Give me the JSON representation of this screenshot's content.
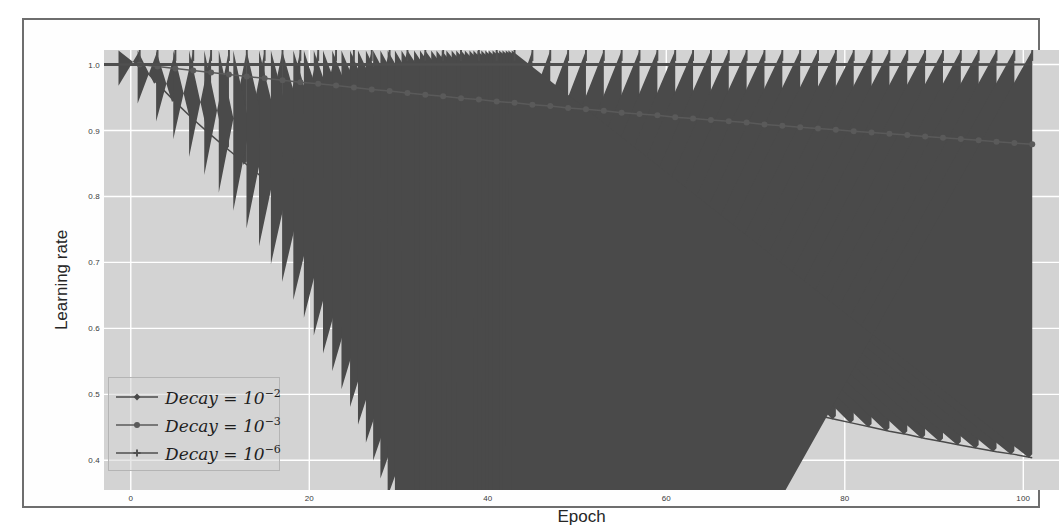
{
  "chart_data": {
    "type": "line",
    "title": "",
    "xlabel": "Epoch",
    "ylabel": "Learning rate",
    "xlim": [
      -3,
      104
    ],
    "ylim": [
      0.355,
      1.022
    ],
    "xticks": [
      "0",
      "20",
      "40",
      "60",
      "80",
      "100"
    ],
    "xtick_values": [
      0,
      20,
      40,
      60,
      80,
      100
    ],
    "yticks": [
      "1.0",
      "0.9",
      "0.8",
      "0.7",
      "0.6",
      "0.5",
      "0.4"
    ],
    "ytick_values": [
      1.0,
      0.9,
      0.8,
      0.7,
      0.6,
      0.5,
      0.4
    ],
    "grid": true,
    "grid_color": "#ffffff",
    "panel_color": "#d3d3d3",
    "legend_position": "lower left",
    "x": [
      1,
      3,
      5,
      7,
      9,
      11,
      13,
      15,
      17,
      19,
      21,
      23,
      25,
      27,
      29,
      31,
      33,
      35,
      37,
      39,
      41,
      43,
      45,
      47,
      49,
      51,
      53,
      55,
      57,
      59,
      61,
      63,
      65,
      67,
      69,
      71,
      73,
      75,
      77,
      79,
      81,
      83,
      85,
      87,
      89,
      91,
      93,
      95,
      97,
      99,
      101
    ],
    "series": [
      {
        "name": "Decay = 10^-2",
        "label_base": "Decay = 10",
        "label_exp": "−2",
        "marker": "diamond",
        "color": "#4a4a4a",
        "values": [
          1.0,
          0.971,
          0.943,
          0.917,
          0.893,
          0.87,
          0.848,
          0.826,
          0.806,
          0.787,
          0.769,
          0.752,
          0.735,
          0.719,
          0.704,
          0.69,
          0.676,
          0.662,
          0.649,
          0.637,
          0.625,
          0.614,
          0.603,
          0.592,
          0.581,
          0.571,
          0.562,
          0.552,
          0.543,
          0.535,
          0.526,
          0.518,
          0.51,
          0.503,
          0.495,
          0.488,
          0.481,
          0.475,
          0.468,
          0.462,
          0.456,
          0.45,
          0.444,
          0.439,
          0.433,
          0.428,
          0.423,
          0.418,
          0.413,
          0.409,
          0.404
        ]
      },
      {
        "name": "Decay = 10^-3",
        "label_base": "Decay = 10",
        "label_exp": "−3",
        "marker": "circle",
        "color": "#5a5a5a",
        "values": [
          1.0,
          0.997,
          0.994,
          0.991,
          0.988,
          0.985,
          0.982,
          0.979,
          0.976,
          0.973,
          0.971,
          0.968,
          0.965,
          0.962,
          0.96,
          0.957,
          0.954,
          0.952,
          0.949,
          0.947,
          0.944,
          0.942,
          0.939,
          0.937,
          0.934,
          0.932,
          0.93,
          0.927,
          0.925,
          0.923,
          0.92,
          0.918,
          0.916,
          0.914,
          0.912,
          0.909,
          0.907,
          0.905,
          0.903,
          0.901,
          0.899,
          0.897,
          0.895,
          0.893,
          0.891,
          0.889,
          0.887,
          0.885,
          0.883,
          0.881,
          0.879
        ]
      },
      {
        "name": "Decay = 10^-6",
        "label_base": "Decay = 10",
        "label_exp": "−6",
        "marker": "plus",
        "color": "#4f4f4f",
        "values": [
          1.0,
          1.0,
          1.0,
          1.0,
          1.0,
          1.0,
          1.0,
          1.0,
          1.0,
          1.0,
          1.0,
          1.0,
          1.0,
          1.0,
          1.0,
          1.0,
          1.0,
          1.0,
          1.0,
          1.0,
          1.0,
          1.0,
          1.0,
          1.0,
          1.0,
          1.0,
          1.0,
          1.0,
          1.0,
          1.0,
          1.0,
          1.0,
          1.0,
          1.0,
          1.0,
          1.0,
          1.0,
          1.0,
          1.0,
          1.0,
          1.0,
          1.0,
          1.0,
          1.0,
          1.0,
          1.0,
          1.0,
          1.0,
          1.0,
          1.0,
          1.0
        ]
      }
    ]
  }
}
